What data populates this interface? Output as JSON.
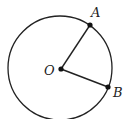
{
  "diagram": {
    "type": "geometry-circle-with-radii",
    "stroke_color": "#222222",
    "background": "#ffffff",
    "circle": {
      "cx": 60,
      "cy": 68,
      "r": 52
    },
    "points": {
      "O": {
        "label": "O",
        "x": 61,
        "y": 69,
        "label_x": 44,
        "label_y": 75
      },
      "A": {
        "label": "A",
        "x": 90,
        "y": 25,
        "label_x": 91,
        "label_y": 17
      },
      "B": {
        "label": "B",
        "x": 108,
        "y": 87,
        "label_x": 113,
        "label_y": 97
      }
    },
    "segments": [
      {
        "from": "O",
        "to": "A"
      },
      {
        "from": "O",
        "to": "B"
      }
    ]
  }
}
